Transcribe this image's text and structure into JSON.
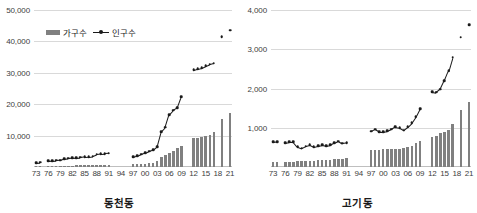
{
  "legend": {
    "households_label": "가구수",
    "population_label": "인구수"
  },
  "panels": [
    {
      "title": "동천동",
      "ylim": [
        0,
        50000
      ],
      "yticks": [
        10000,
        20000,
        30000,
        40000,
        50000
      ],
      "ytick_labels": [
        "10,000",
        "20,000",
        "30,000",
        "40,000",
        "50,000"
      ]
    },
    {
      "title": "고기동",
      "ylim": [
        0,
        4000
      ],
      "yticks": [
        1000,
        2000,
        3000,
        4000
      ],
      "ytick_labels": [
        "1,000",
        "2,000",
        "3,000",
        "4,000"
      ]
    }
  ],
  "xtick_labels": [
    "73",
    "76",
    "79",
    "82",
    "85",
    "88",
    "91",
    "94",
    "97",
    "00",
    "03",
    "06",
    "09",
    "12",
    "15",
    "18",
    "21"
  ],
  "chart_data": [
    {
      "type": "bar",
      "title": "동천동",
      "xlabel": "",
      "ylabel": "",
      "ylim": [
        0,
        50000
      ],
      "grid": true,
      "legend_position": "top-left",
      "x": [
        1973,
        1974,
        1975,
        1976,
        1977,
        1978,
        1979,
        1980,
        1981,
        1982,
        1983,
        1984,
        1985,
        1986,
        1987,
        1988,
        1989,
        1990,
        1991,
        1992,
        1993,
        1994,
        1995,
        1996,
        1997,
        1998,
        1999,
        2000,
        2001,
        2002,
        2003,
        2004,
        2005,
        2006,
        2007,
        2008,
        2009,
        2010,
        2011,
        2012,
        2013,
        2014,
        2015,
        2016,
        2017,
        2018,
        2019,
        2020,
        2021
      ],
      "xtick_labels": [
        "73",
        "76",
        "79",
        "82",
        "85",
        "88",
        "91",
        "94",
        "97",
        "00",
        "03",
        "06",
        "09",
        "12",
        "15",
        "18",
        "21"
      ],
      "series": [
        {
          "name": "가구수",
          "type": "bar",
          "values": [
            380,
            400,
            null,
            420,
            430,
            440,
            450,
            460,
            470,
            480,
            490,
            500,
            510,
            520,
            540,
            560,
            570,
            580,
            600,
            null,
            null,
            null,
            null,
            null,
            820,
            900,
            1000,
            1100,
            1250,
            1400,
            1900,
            3100,
            3900,
            4500,
            5200,
            6000,
            6800,
            null,
            null,
            9100,
            9200,
            9400,
            9900,
            10200,
            11000,
            null,
            15300,
            null,
            17200
          ]
        },
        {
          "name": "인구수",
          "type": "line",
          "values": [
            1400,
            1450,
            null,
            1900,
            2000,
            2100,
            2200,
            2600,
            2750,
            2850,
            2950,
            3050,
            3200,
            3300,
            3450,
            4000,
            4200,
            4300,
            4350,
            null,
            null,
            null,
            null,
            null,
            3200,
            3600,
            4100,
            4500,
            5000,
            5400,
            6500,
            11200,
            12600,
            16700,
            18100,
            18900,
            22300,
            null,
            null,
            30900,
            31300,
            31600,
            32200,
            32700,
            33000,
            null,
            41500,
            null,
            43500
          ]
        }
      ]
    },
    {
      "type": "bar",
      "title": "고기동",
      "xlabel": "",
      "ylabel": "",
      "ylim": [
        0,
        4000
      ],
      "grid": true,
      "legend_position": "none",
      "x": [
        1973,
        1974,
        1975,
        1976,
        1977,
        1978,
        1979,
        1980,
        1981,
        1982,
        1983,
        1984,
        1985,
        1986,
        1987,
        1988,
        1989,
        1990,
        1991,
        1992,
        1993,
        1994,
        1995,
        1996,
        1997,
        1998,
        1999,
        2000,
        2001,
        2002,
        2003,
        2004,
        2005,
        2006,
        2007,
        2008,
        2009,
        2010,
        2011,
        2012,
        2013,
        2014,
        2015,
        2016,
        2017,
        2018,
        2019,
        2020,
        2021
      ],
      "xtick_labels": [
        "73",
        "76",
        "79",
        "82",
        "85",
        "88",
        "91",
        "94",
        "97",
        "00",
        "03",
        "06",
        "09",
        "12",
        "15",
        "18",
        "21"
      ],
      "series": [
        {
          "name": "가구수",
          "type": "bar",
          "values": [
            120,
            125,
            null,
            130,
            135,
            140,
            145,
            150,
            155,
            160,
            165,
            170,
            175,
            180,
            185,
            195,
            205,
            215,
            235,
            null,
            null,
            null,
            null,
            null,
            430,
            440,
            445,
            450,
            455,
            460,
            465,
            470,
            480,
            500,
            540,
            600,
            660,
            null,
            null,
            760,
            800,
            860,
            900,
            950,
            1100,
            null,
            1440,
            null,
            1660
          ]
        },
        {
          "name": "인구수",
          "type": "line",
          "values": [
            640,
            650,
            null,
            620,
            640,
            640,
            520,
            480,
            530,
            560,
            510,
            540,
            560,
            540,
            560,
            620,
            660,
            600,
            610,
            null,
            null,
            null,
            null,
            null,
            910,
            960,
            900,
            900,
            920,
            960,
            1020,
            1000,
            940,
            1020,
            1120,
            1280,
            1480,
            null,
            null,
            1920,
            1900,
            1980,
            2200,
            2450,
            2800,
            null,
            3300,
            null,
            3620
          ]
        }
      ]
    }
  ]
}
